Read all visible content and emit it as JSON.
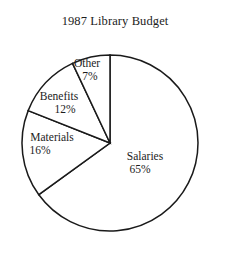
{
  "chart_data": {
    "type": "pie",
    "title": "1987 Library Budget",
    "categories": [
      "Salaries",
      "Materials",
      "Benefits",
      "Other"
    ],
    "values": [
      65,
      16,
      12,
      7
    ],
    "value_unit": "%",
    "labels": [
      {
        "name": "Salaries",
        "percent": "65%",
        "value": 65
      },
      {
        "name": "Materials",
        "percent": "16%",
        "value": 16
      },
      {
        "name": "Benefits",
        "percent": "12%",
        "value": 12
      },
      {
        "name": "Other",
        "percent": "7%",
        "value": 7
      }
    ],
    "total": 100,
    "start_angle_deg": 0,
    "direction": "clockwise",
    "legend": "none",
    "grid": false,
    "slice_fill": "#ffffff",
    "slice_stroke": "#1a1a1a",
    "background": "#ffffff"
  },
  "figure": {
    "title": "1987 Library Budget"
  }
}
